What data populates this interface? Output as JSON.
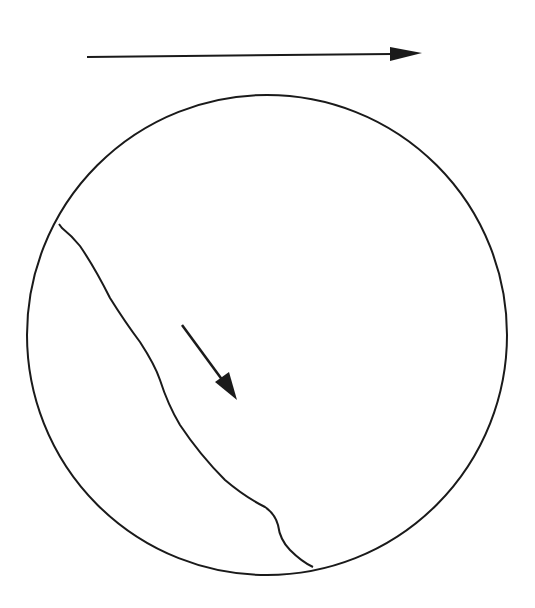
{
  "diagram": {
    "colors": {
      "stroke": "#1a1a1a",
      "background": "#ffffff"
    },
    "elements": {
      "top_arrow": {
        "direction": "right"
      },
      "circle": {
        "shape": "circle"
      },
      "boundary_curve": {
        "shape": "wavy-line"
      },
      "inner_arrow": {
        "direction": "down-right"
      }
    }
  }
}
